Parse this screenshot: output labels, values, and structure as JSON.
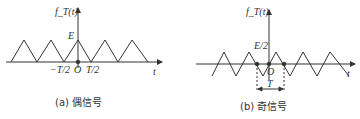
{
  "panel_a": {
    "y_label": "f_T(t)",
    "x_label": "t",
    "peak_label": "E",
    "tick_neg": "−T/2",
    "origin": "O",
    "tick_pos": "T/2",
    "caption": "(a) 偶信号"
  },
  "panel_b": {
    "y_label": "f_T(t)",
    "x_label": "t",
    "peak_label": "E/2",
    "origin": "O",
    "period_label": "T",
    "caption": "(b) 奇信号"
  }
}
